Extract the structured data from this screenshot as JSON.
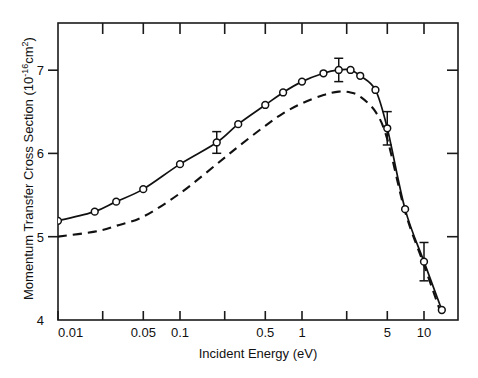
{
  "chart_data": {
    "type": "line",
    "title": "",
    "xlabel": "Incident Energy (eV)",
    "ylabel": "Momentum Transfer Cross Section (10^-16 cm^2)",
    "ylabel_parts": {
      "main": "Momentum Transfer Cross Section (10",
      "exponent": "-16",
      "unit": "cm",
      "unit_exponent": "2",
      "close": ")"
    },
    "xscale": "log",
    "yscale": "linear",
    "xlim": [
      0.01,
      20
    ],
    "ylim": [
      4,
      7.4
    ],
    "grid": false,
    "legend": "none",
    "x_tick_labels": [
      "0.01",
      "0.05",
      "0.1",
      "0.5",
      "1",
      "5",
      "10"
    ],
    "x_tick_values": [
      0.01,
      0.05,
      0.1,
      0.5,
      1,
      5,
      10
    ],
    "x_minor_ticks": [
      0.02,
      0.2,
      2,
      20
    ],
    "y_tick_labels": [
      "4",
      "5",
      "6",
      "7"
    ],
    "y_tick_values": [
      4,
      5,
      6,
      7
    ],
    "series": [
      {
        "name": "measured",
        "style": "solid-with-markers",
        "marker": "open-circle",
        "x": [
          0.01,
          0.02,
          0.03,
          0.05,
          0.1,
          0.2,
          0.3,
          0.5,
          0.7,
          1.0,
          1.5,
          2.0,
          2.5,
          3.0,
          4.0,
          5.0,
          7.0,
          10.0,
          14.0
        ],
        "y": [
          5.19,
          5.3,
          5.42,
          5.57,
          5.87,
          6.13,
          6.35,
          6.58,
          6.73,
          6.86,
          6.96,
          7.0,
          7.0,
          6.93,
          6.76,
          6.3,
          5.33,
          4.7,
          4.12
        ]
      },
      {
        "name": "theory",
        "style": "dashed",
        "marker": "none",
        "x": [
          0.01,
          0.02,
          0.03,
          0.05,
          0.1,
          0.2,
          0.3,
          0.5,
          0.7,
          1.0,
          1.5,
          2.0,
          2.5,
          3.0,
          4.0,
          5.0,
          7.0,
          10.0,
          14.0
        ],
        "y": [
          5.0,
          5.06,
          5.13,
          5.24,
          5.52,
          5.87,
          6.08,
          6.33,
          6.48,
          6.6,
          6.7,
          6.74,
          6.73,
          6.68,
          6.5,
          6.17,
          5.3,
          4.66,
          4.05
        ]
      }
    ],
    "error_bars": [
      {
        "x": 0.2,
        "y": 6.13,
        "err": 0.13
      },
      {
        "x": 5.0,
        "y": 6.3,
        "err": 0.2
      },
      {
        "x": 10.0,
        "y": 4.7,
        "err": 0.23
      },
      {
        "x": 2.0,
        "y": 7.0,
        "err": 0.14
      }
    ]
  }
}
